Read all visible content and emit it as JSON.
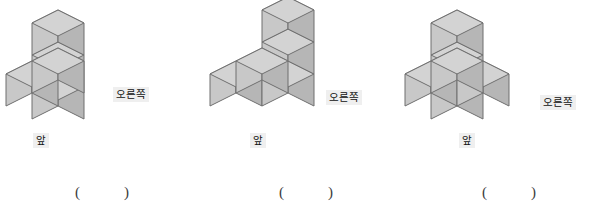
{
  "page": {
    "background": "#ffffff",
    "width": 611,
    "height": 209
  },
  "palette": {
    "cube_top": "#d3d3d3",
    "cube_front": "#c8c8c8",
    "cube_side": "#b6b6b6",
    "cube_stroke": "#6f6f6f",
    "label_bg": "#efefef",
    "label_text": "#111111",
    "paren_text": "#3b3b3b"
  },
  "labels": {
    "right": "오른쪽",
    "front": "앞",
    "paren_open": "(",
    "paren_close": ")",
    "answer_value": ""
  },
  "figures": [
    {
      "id": "figure-1",
      "name": "building-blocks-figure-1",
      "cube_count": 5,
      "right_label": "오른쪽",
      "front_label": "앞",
      "answer": "",
      "cells": [
        {
          "x": 0,
          "y": 0,
          "z": 0
        },
        {
          "x": 0,
          "y": 0,
          "z": 1
        },
        {
          "x": 0,
          "y": 0,
          "z": 2
        },
        {
          "x": 0,
          "y": 1,
          "z": 0
        },
        {
          "x": 1,
          "y": 1,
          "z": 0
        }
      ]
    },
    {
      "id": "figure-2",
      "name": "building-blocks-figure-2",
      "cube_count": 5,
      "right_label": "오른쪽",
      "front_label": "앞",
      "answer": "",
      "cells": [
        {
          "x": 0,
          "y": 1,
          "z": 0
        },
        {
          "x": 1,
          "y": 1,
          "z": 0
        },
        {
          "x": 1,
          "y": 0,
          "z": 0
        },
        {
          "x": 1,
          "y": 0,
          "z": 1
        },
        {
          "x": 1,
          "y": 0,
          "z": 2
        }
      ]
    },
    {
      "id": "figure-3",
      "name": "building-blocks-figure-3",
      "cube_count": 5,
      "right_label": "오른쪽",
      "front_label": "앞",
      "answer": "",
      "cells": [
        {
          "x": 0,
          "y": 1,
          "z": 0
        },
        {
          "x": 1,
          "y": 1,
          "z": 0
        },
        {
          "x": 1,
          "y": 0,
          "z": 0
        },
        {
          "x": 0,
          "y": 0,
          "z": 0
        },
        {
          "x": 0,
          "y": 0,
          "z": 1
        },
        {
          "x": 0,
          "y": 0,
          "z": 2
        }
      ]
    }
  ]
}
